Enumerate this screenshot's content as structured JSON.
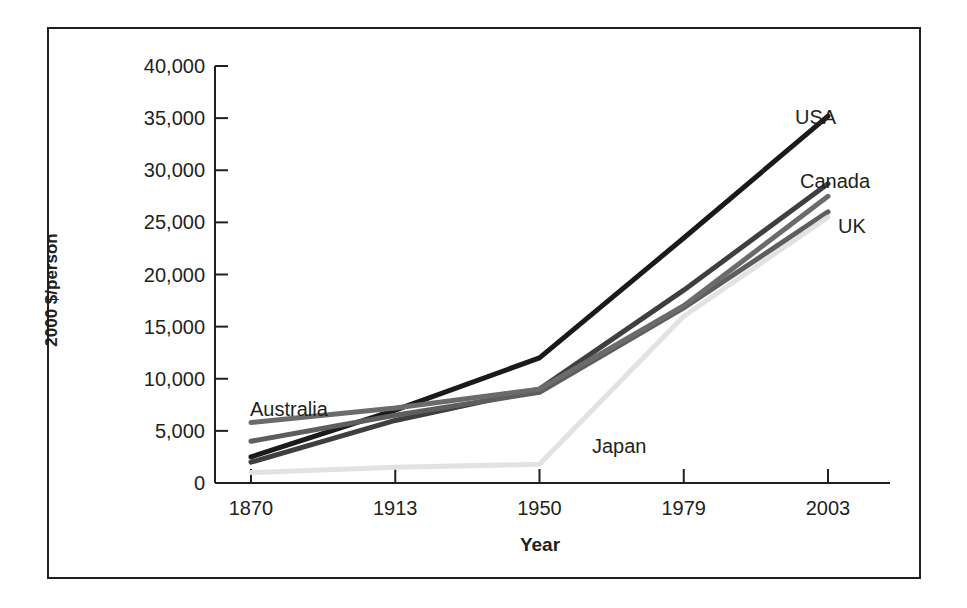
{
  "chart_data": {
    "type": "line",
    "title": "",
    "xlabel": "Year",
    "ylabel": "2000 $/person",
    "categories": [
      "1870",
      "1913",
      "1950",
      "1979",
      "2003"
    ],
    "ylim": [
      0,
      40000
    ],
    "ytick_values": [
      0,
      5000,
      10000,
      15000,
      20000,
      25000,
      30000,
      35000,
      40000
    ],
    "ytick_labels": [
      "0",
      "5,000",
      "10,000",
      "15,000",
      "20,000",
      "25,000",
      "30,000",
      "35,000",
      "40,000"
    ],
    "grid": false,
    "legend_position": "inline-labels",
    "series": [
      {
        "name": "USA",
        "color": "#1a1a1a",
        "values": [
          2500,
          7000,
          12000,
          23500,
          35200
        ],
        "label_x": 795,
        "label_y": 106
      },
      {
        "name": "Canada",
        "color": "#3f3f3f",
        "values": [
          2000,
          6000,
          9000,
          18500,
          28700
        ],
        "label_x": 800,
        "label_y": 170
      },
      {
        "name": "UK",
        "color": "#5e5e5e",
        "values": [
          4000,
          6500,
          8700,
          16800,
          26000
        ],
        "label_x": 838,
        "label_y": 215
      },
      {
        "name": "Australia",
        "color": "#6b6b6b",
        "values": [
          5800,
          7200,
          9000,
          17000,
          27500
        ],
        "label_x": 250,
        "label_y": 398
      },
      {
        "name": "Japan",
        "color": "#e2e2e2",
        "values": [
          1000,
          1500,
          1800,
          16000,
          25500
        ],
        "label_x": 592,
        "label_y": 435
      }
    ]
  },
  "axis": {
    "color": "#231f20",
    "frame_color": "#231f20"
  }
}
